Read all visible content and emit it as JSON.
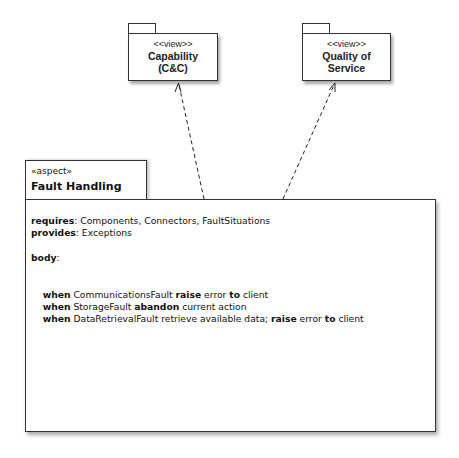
{
  "packages": [
    {
      "stereotype": "<<view>>",
      "name_line1": "Capability",
      "name_line2": "(C&C)"
    },
    {
      "stereotype": "<<view>>",
      "name_line1": "Quality of",
      "name_line2": "Service"
    }
  ],
  "aspect": {
    "stereotype": "«aspect»",
    "name": "Fault Handling",
    "requires_kw": "requires",
    "requires_val": ": Components, Connectors, FaultSituations",
    "provides_kw": "provides",
    "provides_val": ": Exceptions",
    "body_kw": "body",
    "body_colon": ":",
    "rules": [
      {
        "when": "when",
        "a": " CommunicationsFault ",
        "kw": "raise",
        "b": " error ",
        "to": "to",
        "c": " client"
      },
      {
        "when": "when",
        "a": " StorageFault ",
        "kw": "abandon",
        "b": " current action"
      },
      {
        "when": "when",
        "a": " DataRetrievalFault retrieve available data; ",
        "kw": "raise",
        "b": " error ",
        "to": "to",
        "c": " client"
      }
    ]
  },
  "relations": [
    {
      "from": "Fault Handling",
      "to": "Capability (C&C)",
      "style": "dashed-arrow"
    },
    {
      "from": "Fault Handling",
      "to": "Quality of Service",
      "style": "dashed-arrow"
    }
  ]
}
